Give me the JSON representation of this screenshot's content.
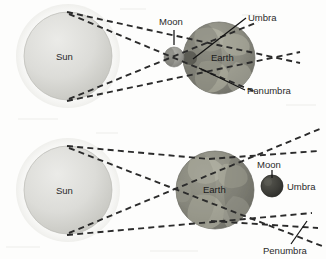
{
  "figure": {
    "background_color": "#fdfdfc",
    "ray_color": "#2b2b2b",
    "ray_style": "dashed",
    "sun_color": "#d2d2cf",
    "earth_color": "#8d8d82",
    "moon_color": "#9a9a95",
    "moon_dark_color": "#3d3d3a",
    "label_color": "#242424"
  },
  "panels": [
    {
      "id": "solar-eclipse",
      "name": "top-panel",
      "description": "Moon between Sun and Earth casting umbra and penumbra on Earth",
      "bodies": [
        {
          "name": "sun",
          "label": "Sun",
          "cx": 68,
          "cy": 56,
          "r": 44
        },
        {
          "name": "moon",
          "label": "Moon",
          "cx": 174,
          "cy": 57,
          "r": 10
        },
        {
          "name": "earth",
          "label": "Earth",
          "cx": 219,
          "cy": 58,
          "r": 36
        }
      ],
      "labels": [
        {
          "name": "sun-label",
          "text": "Sun",
          "x": 56,
          "y": 50
        },
        {
          "name": "moon-label",
          "text": "Moon",
          "x": 159,
          "y": 25
        },
        {
          "name": "earth-label",
          "text": "Earth",
          "x": 211,
          "y": 61
        },
        {
          "name": "umbra-label",
          "text": "Umbra",
          "x": 248,
          "y": 21
        },
        {
          "name": "penumbra-label",
          "text": "Penumbra",
          "x": 247,
          "y": 93
        }
      ]
    },
    {
      "id": "lunar-eclipse",
      "name": "bottom-panel",
      "description": "Earth between Sun and Moon; Moon inside Earth umbra",
      "bodies": [
        {
          "name": "sun",
          "label": "Sun",
          "cx": 68,
          "cy": 190,
          "r": 44
        },
        {
          "name": "earth",
          "label": "Earth",
          "cx": 215,
          "cy": 190,
          "r": 39
        },
        {
          "name": "moon",
          "label": "Moon",
          "cx": 272,
          "cy": 186,
          "r": 11
        }
      ],
      "labels": [
        {
          "name": "sun-label",
          "text": "Sun",
          "x": 56,
          "y": 184
        },
        {
          "name": "earth-label",
          "text": "Earth",
          "x": 205,
          "y": 193
        },
        {
          "name": "moon-label",
          "text": "Moon",
          "x": 258,
          "y": 166
        },
        {
          "name": "umbra-label",
          "text": "Umbra",
          "x": 287,
          "y": 189
        },
        {
          "name": "penumbra-label",
          "text": "Penumbra",
          "x": 264,
          "y": 252
        }
      ]
    }
  ]
}
